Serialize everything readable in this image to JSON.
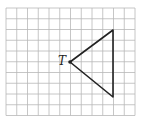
{
  "diagram": {
    "type": "grid-triangle",
    "grid": {
      "cols": 12,
      "rows": 10,
      "origin": [
        6,
        8
      ],
      "cell": 10.75,
      "line_color": "#b8b8b8"
    },
    "triangle": {
      "vertices": [
        [
          70,
          62
        ],
        [
          113,
          30
        ],
        [
          113,
          97
        ]
      ],
      "stroke": "#222222",
      "stroke_width": 1.6
    },
    "point": {
      "label": "T",
      "x": 70,
      "y": 62
    }
  }
}
